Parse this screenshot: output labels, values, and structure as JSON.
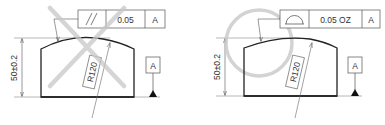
{
  "colors": {
    "line": "#2a2a2a",
    "thin": "#555555",
    "mark": "#c8c8c8",
    "background": "#ffffff"
  },
  "left_drawing": {
    "status": "incorrect",
    "status_mark": "cross",
    "dimension": "50±0.2",
    "radius_label": "R120",
    "frame": {
      "symbol": "parallelism",
      "symbol_glyph": "//",
      "tolerance": "0.05",
      "datum": "A"
    },
    "datum_label": "A"
  },
  "right_drawing": {
    "status": "correct",
    "status_mark": "circle",
    "dimension": "50±0.2",
    "radius_label": "R120",
    "frame": {
      "symbol": "profile-of-a-line",
      "tolerance": "0.05 OZ",
      "datum": "A"
    },
    "datum_label": "A"
  }
}
